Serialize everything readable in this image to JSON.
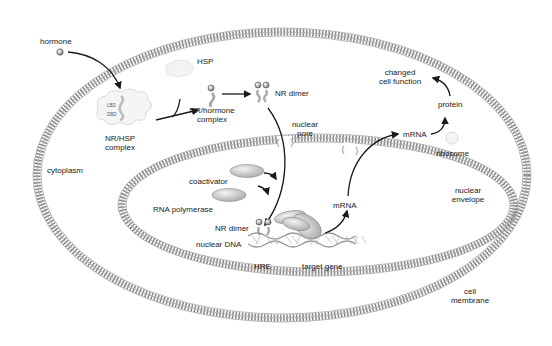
{
  "diagram": {
    "compartments": {
      "cell_membrane": "cell membrane",
      "nuclear_envelope": "nuclear envelope",
      "cytoplasm": "cytoplasm",
      "nuclear_pore": "nuclear pore"
    },
    "labels": {
      "hormone": "hormone",
      "hsp": "HSP",
      "nr_hsp_complex": "NR/HSP complex",
      "nr_hsp_line1": "NR/HSP",
      "nr_hsp_line2": "complex",
      "lbd": "LBD",
      "dbd": "DBD",
      "nr_hormone_line1": "NR/hormone",
      "nr_hormone_line2": "complex",
      "nr_dimer_cyto": "NR dimer",
      "nuclear_pore_line1": "nuclear",
      "nuclear_pore_line2": "pore",
      "coactivator": "coactivator",
      "rna_polymerase": "RNA polymerase",
      "nr_dimer_nuc": "NR dimer",
      "nuclear_dna": "nuclear DNA",
      "hre": "HRE",
      "target_gene": "target gene",
      "mrna_nuc": "mRNA",
      "mrna_cyto": "mRNA",
      "protein": "protein",
      "ribosome": "ribosome",
      "changed_line1": "changed",
      "changed_line2": "cell function",
      "cytoplasm": "cytoplasm",
      "nuclear_env_line1": "nuclear",
      "nuclear_env_line2": "envelope",
      "cell_mem_line1": "cell",
      "cell_mem_line2": "membrane"
    },
    "flow": [
      "hormone",
      "NR/HSP complex",
      "NR/hormone complex",
      "NR dimer",
      "nuclear pore",
      "NR dimer binds HRE",
      "target gene",
      "mRNA",
      "mRNA",
      "protein",
      "changed cell function"
    ],
    "colors": {
      "membrane": "#8a8a8a",
      "arrow": "#1a1a1a",
      "text": "#222222",
      "protein_fill": "#d8d8d8"
    }
  }
}
